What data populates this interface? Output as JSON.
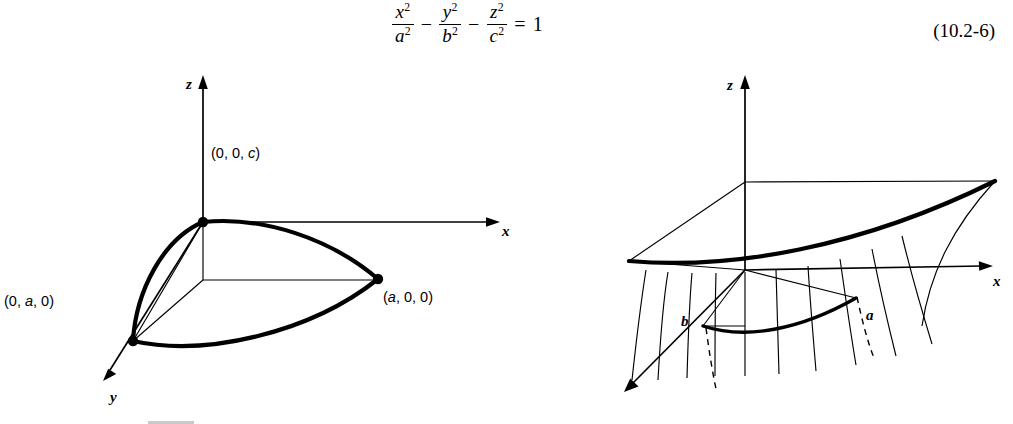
{
  "equation": {
    "terms": [
      {
        "num_var": "x",
        "num_exp": "2",
        "den_var": "a",
        "den_exp": "2"
      },
      {
        "num_var": "y",
        "num_exp": "2",
        "den_var": "b",
        "den_exp": "2"
      },
      {
        "num_var": "z",
        "num_exp": "2",
        "den_var": "c",
        "den_exp": "2"
      }
    ],
    "op1": "−",
    "op2": "−",
    "equals": "=",
    "rhs": "1",
    "number": "(10.2-6)"
  },
  "figures": {
    "left": {
      "name": "ellipsoid-octant",
      "axes": {
        "x_label": "x",
        "y_label": "y",
        "z_label": "z"
      },
      "point_labels": [
        {
          "id": "top-vertex",
          "text": "(0, 0, c)",
          "italic_part": "c"
        },
        {
          "id": "x-vertex",
          "text": "(a, 0, 0)",
          "italic_part": "a"
        },
        {
          "id": "y-vertex",
          "text": "(0, a, 0)",
          "italic_part": "a"
        }
      ]
    },
    "right": {
      "name": "hyperboloid-two-sheets",
      "axes": {
        "x_label": "x",
        "y_label": "y",
        "z_label": "z"
      },
      "point_labels": [
        {
          "id": "x-intercept",
          "text": "a"
        },
        {
          "id": "y-intercept",
          "text": "b"
        }
      ]
    }
  }
}
